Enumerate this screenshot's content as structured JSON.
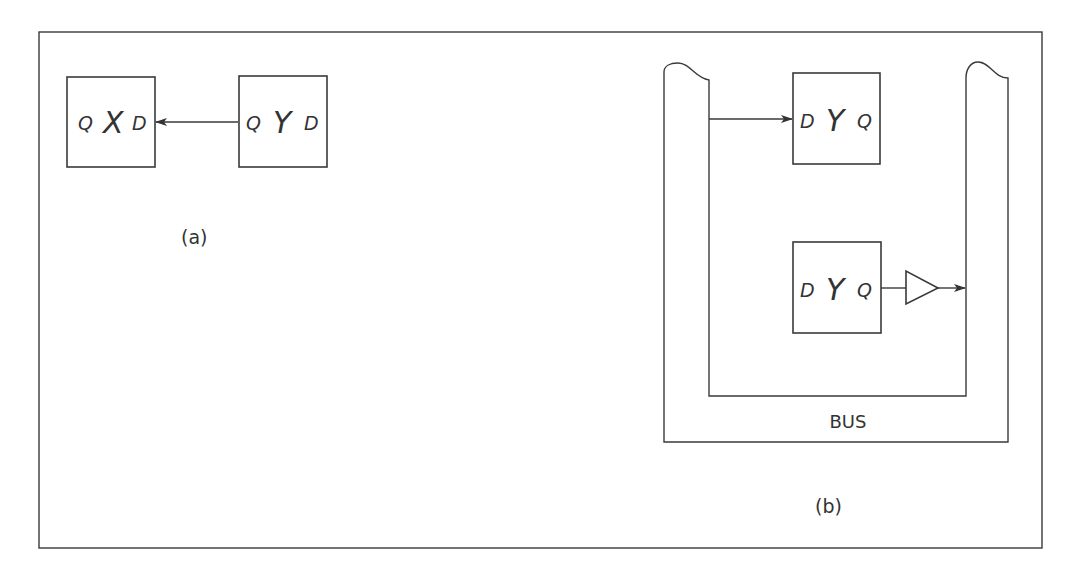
{
  "figure": {
    "part_a": {
      "caption": "(a)",
      "register_x": {
        "name": "X",
        "left_pin": "Q",
        "right_pin": "D"
      },
      "register_y": {
        "name": "Y",
        "left_pin": "Q",
        "right_pin": "D"
      }
    },
    "part_b": {
      "caption": "(b)",
      "bus_label": "BUS",
      "register_top": {
        "name": "Y",
        "left_pin": "D",
        "right_pin": "Q"
      },
      "register_bottom": {
        "name": "Y",
        "left_pin": "D",
        "right_pin": "Q"
      },
      "buffer": "tri-state-buffer"
    }
  },
  "colors": {
    "stroke": "#3a3a3a",
    "text": "#333333",
    "background": "#ffffff"
  }
}
